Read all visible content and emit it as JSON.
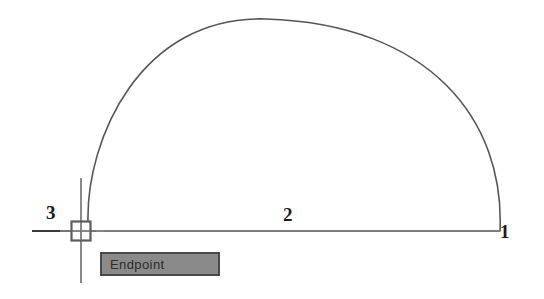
{
  "app": {
    "kind": "cad-drawing-viewport",
    "background_color": "#ffffff"
  },
  "geometry": {
    "line_color": "#555555",
    "chord": {
      "label": "2",
      "from_label": "3",
      "to_label": "1",
      "x1": 32,
      "y1": 231,
      "x2": 500,
      "y2": 231
    },
    "arc": {
      "start_x": 500,
      "start_y": 231,
      "end_x": 88,
      "end_y": 222,
      "apex_x": 266,
      "apex_y": 18
    }
  },
  "labels": {
    "point_1": "1",
    "point_2": "2",
    "point_3": "3"
  },
  "cursor": {
    "crosshair_x": 81,
    "crosshair_top": 178,
    "crosshair_bottom": 283,
    "color": "#777777"
  },
  "osnap": {
    "type": "endpoint",
    "marker_shape": "square",
    "marker_x": 71,
    "marker_y": 221,
    "marker_size": 20,
    "marker_color": "#666666",
    "tooltip": {
      "text": "Endpoint",
      "background_color": "#8a8a8a",
      "border_color": "#4a4a4a",
      "text_color": "#2b2b2b"
    }
  }
}
